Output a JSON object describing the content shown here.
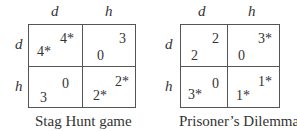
{
  "games": [
    {
      "title": "Stag Hunt game",
      "col_labels": [
        "d",
        "h"
      ],
      "row_labels": [
        "d",
        "h"
      ],
      "cells": [
        [
          {
            "row_payoff": "4*",
            "col_payoff": "4*"
          },
          {
            "row_payoff": "0",
            "col_payoff": "3"
          }
        ],
        [
          {
            "row_payoff": "3",
            "col_payoff": "0"
          },
          {
            "row_payoff": "2*",
            "col_payoff": "2*"
          }
        ]
      ]
    },
    {
      "title": "Prisoner’s Dilemma",
      "col_labels": [
        "d",
        "h"
      ],
      "row_labels": [
        "d",
        "h"
      ],
      "cells": [
        [
          {
            "row_payoff": "2",
            "col_payoff": "2"
          },
          {
            "row_payoff": "0",
            "col_payoff": "3*"
          }
        ],
        [
          {
            "row_payoff": "3*",
            "col_payoff": "0"
          },
          {
            "row_payoff": "1*",
            "col_payoff": "1*"
          }
        ]
      ]
    }
  ]
}
